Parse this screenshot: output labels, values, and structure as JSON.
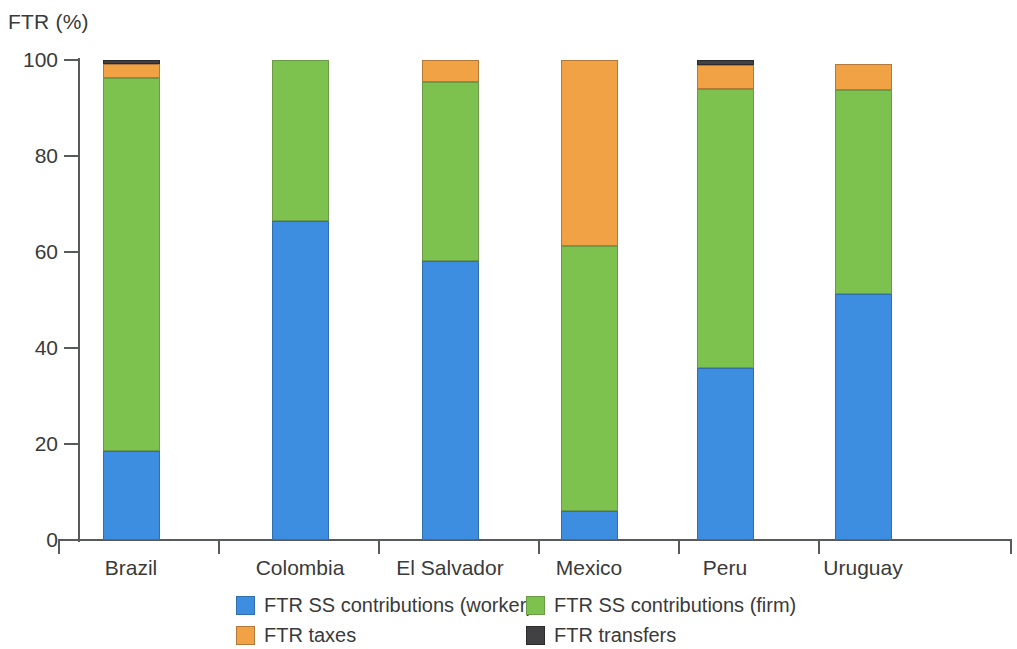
{
  "chart_data": {
    "type": "bar",
    "subtype": "stacked-column-100",
    "title": "",
    "ylabel": "FTR (%)",
    "xlabel": "",
    "ylim": [
      0,
      100
    ],
    "yticks": [
      0,
      20,
      40,
      60,
      80,
      100
    ],
    "ytick_labels": [
      "0",
      "20",
      "40",
      "60",
      "80",
      "100"
    ],
    "grid": false,
    "legend_position": "bottom",
    "categories": [
      "Brazil",
      "Colombia",
      "El Salvador",
      "Mexico",
      "Peru",
      "Uruguay"
    ],
    "series": [
      {
        "name": "FTR SS contributions (worker)",
        "key": "worker",
        "color": "#3d8ee0",
        "values": [
          18.6,
          66.5,
          58.1,
          6.0,
          35.8,
          51.3
        ]
      },
      {
        "name": "FTR SS contributions (firm)",
        "key": "firm",
        "color": "#7dc14f",
        "values": [
          77.7,
          33.5,
          37.3,
          55.3,
          58.1,
          42.4
        ]
      },
      {
        "name": "FTR taxes",
        "key": "taxes",
        "color": "#f0a244",
        "values": [
          2.9,
          0.0,
          4.6,
          38.7,
          5.1,
          5.4
        ]
      },
      {
        "name": "FTR transfers",
        "key": "transfers",
        "color": "#414042",
        "values": [
          0.8,
          0.0,
          0.0,
          0.0,
          1.0,
          0.0
        ]
      }
    ],
    "stack_totals": [
      100.0,
      100.0,
      100.0,
      100.0,
      100.0,
      99.1
    ]
  },
  "axis": {
    "y_title": "FTR (%)"
  },
  "legend": {
    "items": [
      {
        "label": "FTR SS contributions (worker)",
        "key": "worker"
      },
      {
        "label": "FTR SS contributions (firm)",
        "key": "firm"
      },
      {
        "label": "FTR taxes",
        "key": "taxes"
      },
      {
        "label": "FTR transfers",
        "key": "transfers"
      }
    ]
  }
}
